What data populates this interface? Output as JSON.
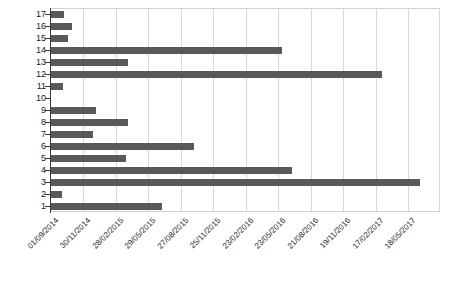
{
  "chart_data": {
    "type": "bar",
    "orientation": "horizontal",
    "title": "",
    "subtitle": "",
    "xlabel": "",
    "ylabel": "",
    "grid": true,
    "legend": false,
    "legend_position": "none",
    "bar_color": "#595959",
    "axis_color": "#3a3a3a",
    "gridline_color": "#d8d8d8",
    "x_axis": {
      "type": "date",
      "tick_labels": [
        "01/09/2014",
        "30/11/2014",
        "28/02/2015",
        "29/05/2015",
        "27/08/2015",
        "25/11/2015",
        "23/02/2016",
        "23/05/2016",
        "21/08/2016",
        "19/11/2016",
        "17/02/2017",
        "18/05/2017"
      ],
      "range": [
        "01/09/2014",
        "18/05/2017"
      ]
    },
    "y_axis": {
      "categories": [
        "17",
        "16",
        "15",
        "14",
        "13",
        "12",
        "11",
        "10",
        "9",
        "8",
        "7",
        "6",
        "5",
        "4",
        "3",
        "2",
        "1"
      ],
      "range": [
        1,
        17
      ]
    },
    "categories": [
      "1",
      "2",
      "3",
      "4",
      "5",
      "6",
      "7",
      "8",
      "9",
      "10",
      "11",
      "12",
      "13",
      "14",
      "15",
      "16",
      "17"
    ],
    "values_days": [
      310,
      33,
      1025,
      670,
      211,
      399,
      119,
      216,
      127,
      0,
      36,
      920,
      216,
      642,
      50,
      61,
      39
    ],
    "end_dates": [
      "08/07/2015",
      "04/10/2014",
      "22/06/2017",
      "02/07/2016",
      "31/03/2015",
      "04/10/2015",
      "29/12/2014",
      "05/04/2015",
      "06/01/2015",
      "01/09/2014",
      "07/10/2014",
      "09/03/2017",
      "05/04/2015",
      "04/06/2016",
      "21/10/2014",
      "01/11/2014",
      "10/10/2014"
    ],
    "bars_px": [
      {
        "category": "17",
        "y": 14,
        "x_start": 51,
        "width": 13
      },
      {
        "category": "16",
        "y": 26,
        "x_start": 51,
        "width": 21
      },
      {
        "category": "15",
        "y": 38,
        "x_start": 51,
        "width": 17
      },
      {
        "category": "14",
        "y": 50,
        "x_start": 51,
        "width": 231
      },
      {
        "category": "13",
        "y": 62,
        "x_start": 51,
        "width": 77
      },
      {
        "category": "12",
        "y": 74,
        "x_start": 51,
        "width": 331
      },
      {
        "category": "11",
        "y": 86,
        "x_start": 51,
        "width": 12
      },
      {
        "category": "10",
        "y": 98,
        "x_start": 51,
        "width": 0
      },
      {
        "category": "9",
        "y": 110,
        "x_start": 51,
        "width": 45
      },
      {
        "category": "8",
        "y": 122,
        "x_start": 51,
        "width": 77
      },
      {
        "category": "7",
        "y": 134,
        "x_start": 51,
        "width": 42
      },
      {
        "category": "6",
        "y": 146,
        "x_start": 51,
        "width": 143
      },
      {
        "category": "5",
        "y": 158,
        "x_start": 51,
        "width": 75
      },
      {
        "category": "4",
        "y": 170,
        "x_start": 51,
        "width": 241
      },
      {
        "category": "3",
        "y": 182,
        "x_start": 51,
        "width": 369
      },
      {
        "category": "2",
        "y": 194,
        "x_start": 51,
        "width": 11
      },
      {
        "category": "1",
        "y": 206,
        "x_start": 51,
        "width": 111
      }
    ],
    "gridlines_px": [
      83,
      116,
      148,
      181,
      213,
      246,
      278,
      311,
      343,
      376,
      408,
      439
    ],
    "y_ticks_px": [
      14,
      26,
      38,
      50,
      62,
      74,
      86,
      98,
      110,
      122,
      134,
      146,
      158,
      170,
      182,
      194,
      206
    ],
    "y_labels": [
      {
        "text": "17",
        "y": 9
      },
      {
        "text": "16",
        "y": 21
      },
      {
        "text": "15",
        "y": 33
      },
      {
        "text": "14",
        "y": 45
      },
      {
        "text": "13",
        "y": 57
      },
      {
        "text": "12",
        "y": 69
      },
      {
        "text": "11",
        "y": 81
      },
      {
        "text": "10",
        "y": 93
      },
      {
        "text": "9",
        "y": 105
      },
      {
        "text": "8",
        "y": 117
      },
      {
        "text": "7",
        "y": 129
      },
      {
        "text": "6",
        "y": 141
      },
      {
        "text": "5",
        "y": 153
      },
      {
        "text": "4",
        "y": 165
      },
      {
        "text": "3",
        "y": 177
      },
      {
        "text": "2",
        "y": 189
      },
      {
        "text": "1",
        "y": 201
      }
    ],
    "x_labels_px": [
      {
        "text": "01/09/2014",
        "x": 54
      },
      {
        "text": "30/11/2014",
        "x": 86
      },
      {
        "text": "28/02/2015",
        "x": 119
      },
      {
        "text": "29/05/2015",
        "x": 151
      },
      {
        "text": "27/08/2015",
        "x": 184
      },
      {
        "text": "25/11/2015",
        "x": 216
      },
      {
        "text": "23/02/2016",
        "x": 249
      },
      {
        "text": "23/05/2016",
        "x": 281
      },
      {
        "text": "21/08/2016",
        "x": 314
      },
      {
        "text": "19/11/2016",
        "x": 346
      },
      {
        "text": "17/02/2017",
        "x": 379
      },
      {
        "text": "18/05/2017",
        "x": 411
      }
    ]
  }
}
